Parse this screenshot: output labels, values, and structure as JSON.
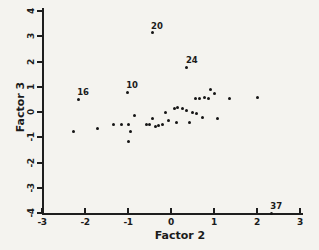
{
  "figure": {
    "background": "#f4f3ef",
    "ink": "#1b1b1b"
  },
  "chart_data": {
    "type": "scatter",
    "title": "",
    "xlabel": "Factor 2",
    "ylabel": "Factor 3",
    "xlim": [
      -3,
      3
    ],
    "ylim": [
      -4,
      4
    ],
    "x_ticks": [
      -3,
      -2,
      -1,
      0,
      1,
      2,
      3
    ],
    "y_ticks": [
      4,
      3,
      2,
      1,
      0,
      -1,
      -2,
      -3,
      -4
    ],
    "grid": false,
    "legend": "none",
    "points": [
      {
        "x": -2.26,
        "y": -0.79
      },
      {
        "x": -2.16,
        "y": 0.51,
        "label": "16"
      },
      {
        "x": -1.72,
        "y": -0.67
      },
      {
        "x": -1.33,
        "y": -0.48
      },
      {
        "x": -1.14,
        "y": -0.48
      },
      {
        "x": -1.02,
        "y": 0.79,
        "label": "10"
      },
      {
        "x": -0.98,
        "y": -0.51
      },
      {
        "x": -0.98,
        "y": -1.15
      },
      {
        "x": -0.95,
        "y": -0.79
      },
      {
        "x": -0.86,
        "y": -0.12
      },
      {
        "x": -0.58,
        "y": -0.51
      },
      {
        "x": -0.49,
        "y": -0.48
      },
      {
        "x": -0.44,
        "y": 3.13,
        "label": "20"
      },
      {
        "x": -0.42,
        "y": -0.24
      },
      {
        "x": -0.37,
        "y": -0.59
      },
      {
        "x": -0.28,
        "y": -0.55
      },
      {
        "x": -0.19,
        "y": -0.48
      },
      {
        "x": -0.12,
        "y": 0.0
      },
      {
        "x": -0.05,
        "y": -0.32
      },
      {
        "x": 0.07,
        "y": 0.12
      },
      {
        "x": 0.12,
        "y": -0.4
      },
      {
        "x": 0.16,
        "y": 0.16
      },
      {
        "x": 0.26,
        "y": 0.12
      },
      {
        "x": 0.37,
        "y": 1.78,
        "label": "24"
      },
      {
        "x": 0.37,
        "y": 0.04
      },
      {
        "x": 0.44,
        "y": -0.4
      },
      {
        "x": 0.49,
        "y": 0.0
      },
      {
        "x": 0.56,
        "y": 0.52
      },
      {
        "x": 0.6,
        "y": -0.04
      },
      {
        "x": 0.67,
        "y": 0.52
      },
      {
        "x": 0.74,
        "y": -0.2
      },
      {
        "x": 0.79,
        "y": 0.59
      },
      {
        "x": 0.88,
        "y": 0.55
      },
      {
        "x": 0.93,
        "y": 0.91
      },
      {
        "x": 1.0,
        "y": 0.75
      },
      {
        "x": 1.07,
        "y": -0.24
      },
      {
        "x": 1.35,
        "y": 0.52
      },
      {
        "x": 2.0,
        "y": 0.59
      },
      {
        "x": 2.33,
        "y": -4.0,
        "label": "37"
      }
    ]
  }
}
